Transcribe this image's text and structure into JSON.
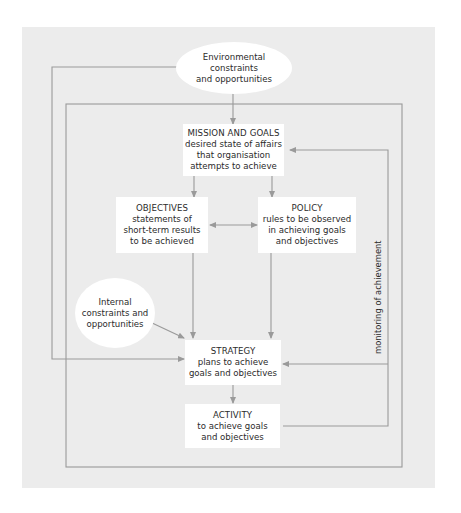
{
  "diagram": {
    "type": "flow",
    "colors": {
      "panel_background": "#ececec",
      "node_background": "#ffffff",
      "line": "#9a9a9a",
      "text": "#2b2b2b"
    },
    "external_nodes": {
      "environmental": {
        "text": "Environmental constraints and opportunities",
        "line1": "Environmental constraints",
        "line2": "and opportunities",
        "shape": "ellipse"
      },
      "internal": {
        "line1": "Internal",
        "line2": "constraints and",
        "line3": "opportunities",
        "shape": "circle"
      }
    },
    "nodes": {
      "mission": {
        "title": "MISSION AND GOALS",
        "desc1": "desired state of affairs",
        "desc2": "that organisation",
        "desc3": "attempts to achieve"
      },
      "objectives": {
        "title": "OBJECTIVES",
        "desc1": "statements of",
        "desc2": "short-term results",
        "desc3": "to be achieved"
      },
      "policy": {
        "title": "POLICY",
        "desc1": "rules to be observed",
        "desc2": "in achieving goals",
        "desc3": "and objectives"
      },
      "strategy": {
        "title": "STRATEGY",
        "desc1": "plans to achieve",
        "desc2": "goals and objectives"
      },
      "activity": {
        "title": "ACTIVITY",
        "desc1": "to achieve goals",
        "desc2": "and objectives"
      }
    },
    "feedback_label": "monitoring of achievement",
    "edges": [
      {
        "from": "environmental",
        "to": "mission"
      },
      {
        "from": "environmental",
        "to": "strategy"
      },
      {
        "from": "mission",
        "to": "objectives"
      },
      {
        "from": "mission",
        "to": "policy"
      },
      {
        "from": "objectives",
        "to": "policy",
        "bidirectional": true
      },
      {
        "from": "objectives",
        "to": "strategy"
      },
      {
        "from": "policy",
        "to": "strategy"
      },
      {
        "from": "internal",
        "to": "strategy"
      },
      {
        "from": "strategy",
        "to": "activity"
      },
      {
        "from": "activity",
        "to": "strategy",
        "label": "monitoring of achievement"
      },
      {
        "from": "activity",
        "to": "mission",
        "label": "monitoring of achievement"
      }
    ]
  }
}
